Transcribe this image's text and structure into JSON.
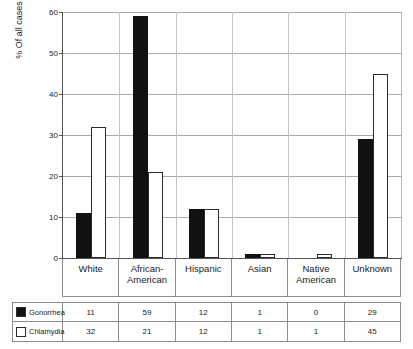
{
  "chart_data": {
    "type": "bar",
    "title": "",
    "xlabel": "",
    "ylabel": "% Of all cases",
    "ylim": [
      0,
      60
    ],
    "yticks": [
      0,
      10,
      20,
      30,
      40,
      50,
      60
    ],
    "grid": true,
    "legend_position": "table-below",
    "categories": [
      "White",
      "African-American",
      "Hispanic",
      "Asian",
      "Native American",
      "Unknown"
    ],
    "series": [
      {
        "name": "Gonorrhea",
        "color": "#111111",
        "style": "filled",
        "values": [
          11,
          59,
          12,
          1,
          0,
          29
        ]
      },
      {
        "name": "Chlamydia",
        "color": "#ffffff",
        "style": "hollow",
        "values": [
          32,
          21,
          12,
          1,
          1,
          45
        ]
      }
    ]
  },
  "axis": {
    "y_title": "% Of all cases",
    "tick_labels": [
      "0",
      "10",
      "20",
      "30",
      "40",
      "50",
      "60"
    ]
  },
  "category_labels": [
    "White",
    "African-American",
    "Hispanic",
    "Asian",
    "Native American",
    "Unknown"
  ],
  "table": {
    "rows": [
      {
        "label": "Gonorrhea",
        "swatch": "filled-black-square-icon",
        "values": [
          "11",
          "59",
          "12",
          "1",
          "0",
          "29"
        ]
      },
      {
        "label": "Chlamydia",
        "swatch": "hollow-white-square-icon",
        "values": [
          "32",
          "21",
          "12",
          "1",
          "1",
          "45"
        ]
      }
    ]
  }
}
